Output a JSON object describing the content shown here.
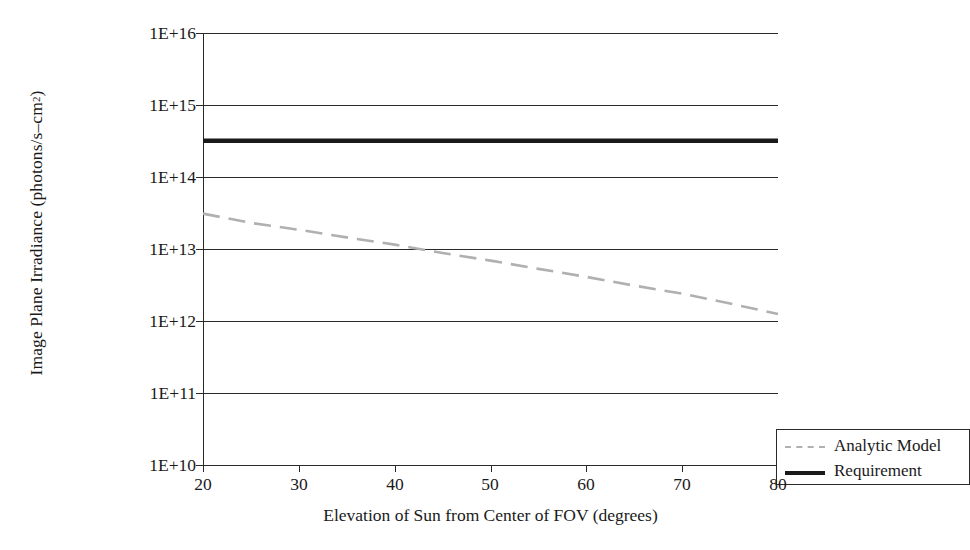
{
  "chart_data": {
    "type": "line",
    "title": "",
    "xlabel": "Elevation of Sun from Center of FOV (degrees)",
    "ylabel_text": "Image Plane Irradiance (photons/s–cm",
    "ylabel_sup": "2",
    "ylabel_tail": ")",
    "ylabel_full": "Image Plane Irradiance (photons/s–cm2)",
    "xlim": [
      20,
      80
    ],
    "ylim": [
      10000000000.0,
      1e+16
    ],
    "yscale": "log",
    "xticks": [
      20,
      30,
      40,
      50,
      60,
      70,
      80
    ],
    "xticklabels": [
      "20",
      "30",
      "40",
      "50",
      "60",
      "70",
      "80"
    ],
    "yticks": [
      10000000000.0,
      100000000000.0,
      1000000000000.0,
      10000000000000.0,
      100000000000000.0,
      1000000000000000.0,
      1e+16
    ],
    "yticklabels": [
      "1E+16",
      "1E+15",
      "1E+14",
      "1E+13",
      "1E+12",
      "1E+11",
      "1E+10"
    ],
    "grid": "horizontal",
    "legend_position": "lower-right",
    "series": [
      {
        "name": "Analytic Model",
        "style": "dashed",
        "color": "#b0b0b0",
        "x": [
          20,
          25,
          30,
          35,
          40,
          45,
          50,
          55,
          60,
          65,
          70,
          75,
          80
        ],
        "y": [
          31000000000000.0,
          23000000000000.0,
          18500000000000.0,
          14500000000000.0,
          11500000000000.0,
          8800000000000.0,
          6900000000000.0,
          5300000000000.0,
          4100000000000.0,
          3100000000000.0,
          2400000000000.0,
          1750000000000.0,
          1250000000000.0
        ]
      },
      {
        "name": "Requirement",
        "style": "solid",
        "color": "#1a1a1a",
        "x": [
          20,
          80
        ],
        "y": [
          320000000000000.0,
          320000000000000.0
        ]
      }
    ]
  },
  "legend": {
    "entries": [
      {
        "label": "Analytic Model",
        "swatch": "dashed-gray-line"
      },
      {
        "label": "Requirement",
        "swatch": "solid-black-line"
      }
    ]
  },
  "axes": {
    "x_title": "Elevation of Sun from Center of FOV (degrees)",
    "y_title_main": "Image Plane Irradiance (photons/s–cm",
    "y_title_sup": "2",
    "y_title_close": ")",
    "x_tick_labels": [
      "20",
      "30",
      "40",
      "50",
      "60",
      "70",
      "80"
    ],
    "y_tick_labels": [
      "1E+16",
      "1E+15",
      "1E+14",
      "1E+13",
      "1E+12",
      "1E+11",
      "1E+10"
    ]
  },
  "colors": {
    "axis": "#2a2a2a",
    "grid": "#2a2a2a",
    "analytic_model": "#b0b0b0",
    "requirement": "#1a1a1a",
    "background": "#ffffff"
  }
}
